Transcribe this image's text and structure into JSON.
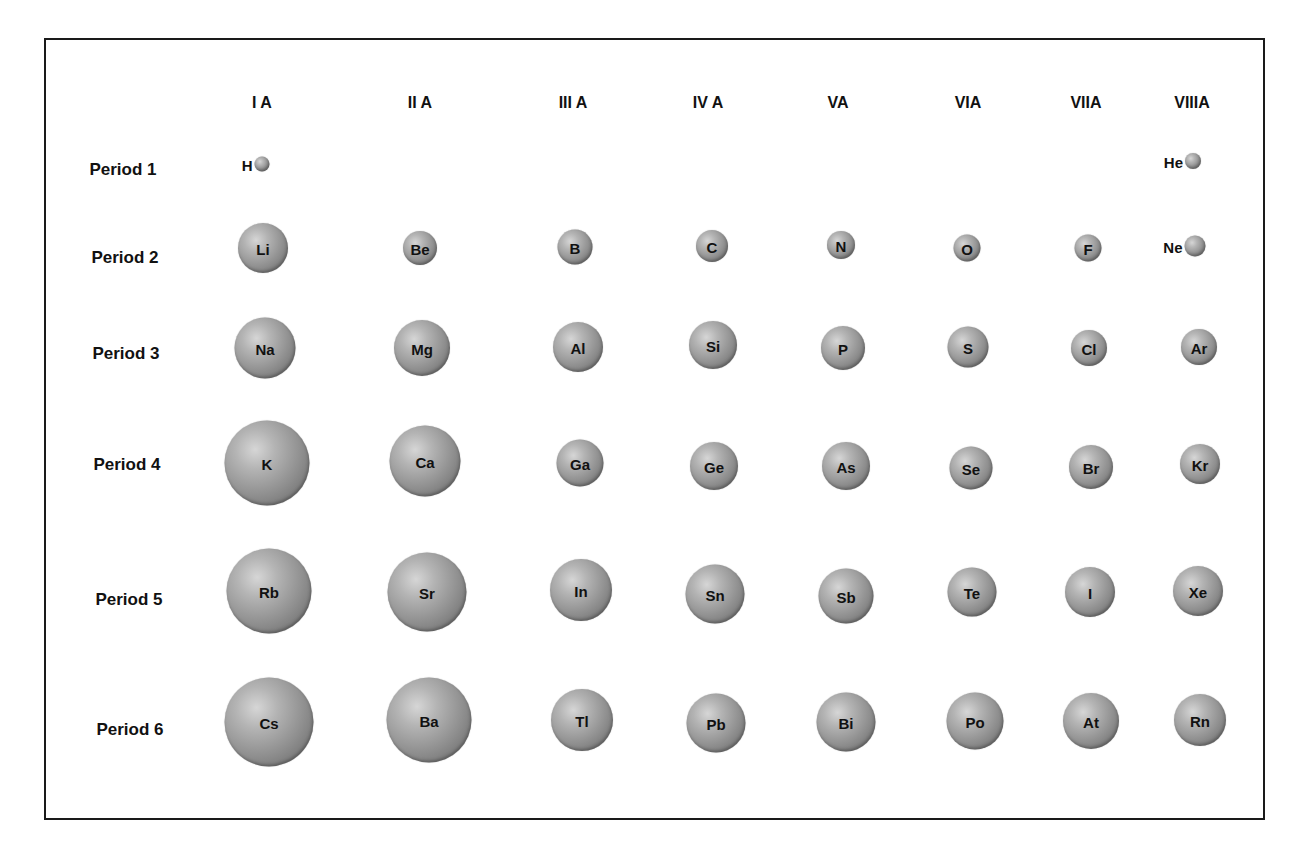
{
  "groups": [
    {
      "label": "I A",
      "x": 262
    },
    {
      "label": "II A",
      "x": 420
    },
    {
      "label": "III A",
      "x": 573
    },
    {
      "label": "IV A",
      "x": 708
    },
    {
      "label": "VA",
      "x": 838
    },
    {
      "label": "VIA",
      "x": 968
    },
    {
      "label": "VIIA",
      "x": 1086
    },
    {
      "label": "VIIIA",
      "x": 1192
    }
  ],
  "header_y": 103,
  "periods": [
    {
      "label": "Period 1",
      "x": 123,
      "y": 170
    },
    {
      "label": "Period 2",
      "x": 125,
      "y": 258
    },
    {
      "label": "Period 3",
      "x": 126,
      "y": 354
    },
    {
      "label": "Period 4",
      "x": 127,
      "y": 465
    },
    {
      "label": "Period 5",
      "x": 129,
      "y": 600
    },
    {
      "label": "Period 6",
      "x": 130,
      "y": 730
    }
  ],
  "elements": [
    {
      "symbol": "H",
      "period": 1,
      "group": "I A",
      "x": 262,
      "y": 164,
      "d": 15,
      "label_outside": true
    },
    {
      "symbol": "He",
      "period": 1,
      "group": "VIIIA",
      "x": 1193,
      "y": 161,
      "d": 16,
      "label_outside": true
    },
    {
      "symbol": "Li",
      "period": 2,
      "group": "I A",
      "x": 263,
      "y": 248,
      "d": 50
    },
    {
      "symbol": "Be",
      "period": 2,
      "group": "II A",
      "x": 420,
      "y": 248,
      "d": 34
    },
    {
      "symbol": "B",
      "period": 2,
      "group": "III A",
      "x": 575,
      "y": 247,
      "d": 35
    },
    {
      "symbol": "C",
      "period": 2,
      "group": "IV A",
      "x": 712,
      "y": 246,
      "d": 32
    },
    {
      "symbol": "N",
      "period": 2,
      "group": "VA",
      "x": 841,
      "y": 245,
      "d": 28
    },
    {
      "symbol": "O",
      "period": 2,
      "group": "VIA",
      "x": 967,
      "y": 248,
      "d": 27
    },
    {
      "symbol": "F",
      "period": 2,
      "group": "VIIA",
      "x": 1088,
      "y": 248,
      "d": 27
    },
    {
      "symbol": "Ne",
      "period": 2,
      "group": "VIIIA",
      "x": 1195,
      "y": 246,
      "d": 21,
      "label_outside": true
    },
    {
      "symbol": "Na",
      "period": 3,
      "group": "I A",
      "x": 265,
      "y": 348,
      "d": 61
    },
    {
      "symbol": "Mg",
      "period": 3,
      "group": "II A",
      "x": 422,
      "y": 348,
      "d": 56
    },
    {
      "symbol": "Al",
      "period": 3,
      "group": "III A",
      "x": 578,
      "y": 347,
      "d": 50
    },
    {
      "symbol": "Si",
      "period": 3,
      "group": "IV A",
      "x": 713,
      "y": 345,
      "d": 48
    },
    {
      "symbol": "P",
      "period": 3,
      "group": "VA",
      "x": 843,
      "y": 348,
      "d": 44
    },
    {
      "symbol": "S",
      "period": 3,
      "group": "VIA",
      "x": 968,
      "y": 347,
      "d": 41
    },
    {
      "symbol": "Cl",
      "period": 3,
      "group": "VIIA",
      "x": 1089,
      "y": 348,
      "d": 36
    },
    {
      "symbol": "Ar",
      "period": 3,
      "group": "VIIIA",
      "x": 1199,
      "y": 347,
      "d": 36
    },
    {
      "symbol": "K",
      "period": 4,
      "group": "I A",
      "x": 267,
      "y": 463,
      "d": 85
    },
    {
      "symbol": "Ca",
      "period": 4,
      "group": "II A",
      "x": 425,
      "y": 461,
      "d": 71
    },
    {
      "symbol": "Ga",
      "period": 4,
      "group": "III A",
      "x": 580,
      "y": 463,
      "d": 47
    },
    {
      "symbol": "Ge",
      "period": 4,
      "group": "IV A",
      "x": 714,
      "y": 466,
      "d": 48
    },
    {
      "symbol": "As",
      "period": 4,
      "group": "VA",
      "x": 846,
      "y": 466,
      "d": 48
    },
    {
      "symbol": "Se",
      "period": 4,
      "group": "VIA",
      "x": 971,
      "y": 468,
      "d": 43
    },
    {
      "symbol": "Br",
      "period": 4,
      "group": "VIIA",
      "x": 1091,
      "y": 467,
      "d": 44
    },
    {
      "symbol": "Kr",
      "period": 4,
      "group": "VIIIA",
      "x": 1200,
      "y": 464,
      "d": 40
    },
    {
      "symbol": "Rb",
      "period": 5,
      "group": "I A",
      "x": 269,
      "y": 591,
      "d": 85
    },
    {
      "symbol": "Sr",
      "period": 5,
      "group": "II A",
      "x": 427,
      "y": 592,
      "d": 79
    },
    {
      "symbol": "In",
      "period": 5,
      "group": "III A",
      "x": 581,
      "y": 590,
      "d": 62
    },
    {
      "symbol": "Sn",
      "period": 5,
      "group": "IV A",
      "x": 715,
      "y": 594,
      "d": 59
    },
    {
      "symbol": "Sb",
      "period": 5,
      "group": "VA",
      "x": 846,
      "y": 596,
      "d": 55
    },
    {
      "symbol": "Te",
      "period": 5,
      "group": "VIA",
      "x": 972,
      "y": 592,
      "d": 49
    },
    {
      "symbol": "I",
      "period": 5,
      "group": "VIIA",
      "x": 1090,
      "y": 592,
      "d": 50
    },
    {
      "symbol": "Xe",
      "period": 5,
      "group": "VIIIA",
      "x": 1198,
      "y": 591,
      "d": 50
    },
    {
      "symbol": "Cs",
      "period": 6,
      "group": "I A",
      "x": 269,
      "y": 722,
      "d": 89
    },
    {
      "symbol": "Ba",
      "period": 6,
      "group": "II A",
      "x": 429,
      "y": 720,
      "d": 85
    },
    {
      "symbol": "Tl",
      "period": 6,
      "group": "III A",
      "x": 582,
      "y": 720,
      "d": 62
    },
    {
      "symbol": "Pb",
      "period": 6,
      "group": "IV A",
      "x": 716,
      "y": 723,
      "d": 59
    },
    {
      "symbol": "Bi",
      "period": 6,
      "group": "VA",
      "x": 846,
      "y": 722,
      "d": 59
    },
    {
      "symbol": "Po",
      "period": 6,
      "group": "VIA",
      "x": 975,
      "y": 721,
      "d": 57
    },
    {
      "symbol": "At",
      "period": 6,
      "group": "VIIA",
      "x": 1091,
      "y": 721,
      "d": 56
    },
    {
      "symbol": "Rn",
      "period": 6,
      "group": "VIIIA",
      "x": 1200,
      "y": 720,
      "d": 52
    }
  ],
  "colors": {
    "border": "#1a1a1a",
    "sphere_light": "#d6d6d6",
    "sphere_dark": "#5e5e5e",
    "text": "#111111"
  }
}
